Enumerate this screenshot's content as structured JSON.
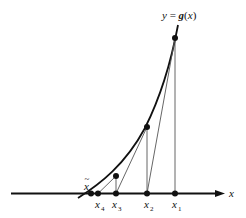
{
  "figure": {
    "type": "diagram",
    "curve_label": "y = g(x)",
    "axis_label": "x",
    "root_label": "x̃",
    "iterates": [
      {
        "name": "x",
        "sub": "1"
      },
      {
        "name": "x",
        "sub": "2"
      },
      {
        "name": "x",
        "sub": "3"
      },
      {
        "name": "x",
        "sub": "4"
      }
    ]
  },
  "labels": {
    "curve_y": "y",
    "curve_eq": " = ",
    "curve_g": "g",
    "curve_arg_open": "(",
    "curve_arg": "x",
    "curve_arg_close": ")",
    "axis": "x",
    "root": "x",
    "root_tilde": "~",
    "x1": "x",
    "x1_sub": "1",
    "x2": "x",
    "x2_sub": "2",
    "x3": "x",
    "x3_sub": "3",
    "x4": "x",
    "x4_sub": "4"
  },
  "colors": {
    "line": "#111111",
    "background": "#ffffff"
  }
}
